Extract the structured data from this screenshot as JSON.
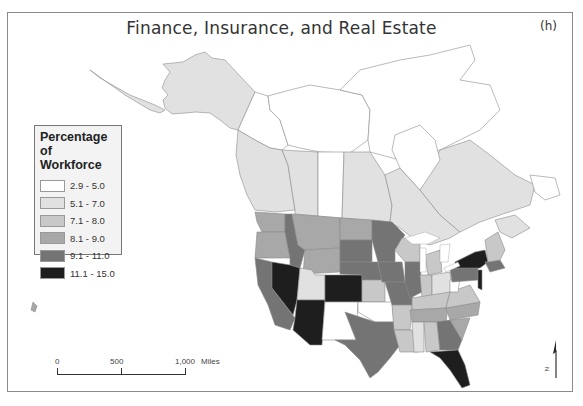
{
  "map": {
    "title": "Finance, Insurance, and Real Estate",
    "panel_label": "(h)",
    "legend": {
      "title": "Percentage of Workforce",
      "title_line1": "Percentage of",
      "title_line2": "Workforce",
      "classes": [
        {
          "label": "2.9 - 5.0",
          "color": "#ffffff"
        },
        {
          "label": "5.1 - 7.0",
          "color": "#e1e1e1"
        },
        {
          "label": "7.1 - 8.0",
          "color": "#c8c8c8"
        },
        {
          "label": "8.1 - 9.0",
          "color": "#a8a8a8"
        },
        {
          "label": "9.1 - 11.0",
          "color": "#747474"
        },
        {
          "label": "11.1 - 15.0",
          "color": "#1e1e1e"
        }
      ]
    },
    "scalebar": {
      "ticks": [
        "0",
        "500",
        "1,000"
      ],
      "unit": "Miles"
    },
    "north_arrow": {
      "label": "N"
    }
  }
}
